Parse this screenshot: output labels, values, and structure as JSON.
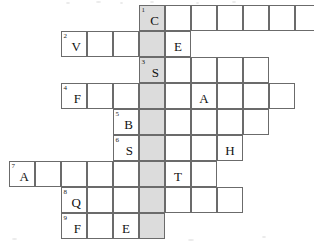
{
  "puzzle": {
    "type": "crossword",
    "title": "",
    "cell_size": 26,
    "grid_origin": {
      "x": 9,
      "y": 5
    },
    "shaded_column_index": 5,
    "shaded_color": "#dcdcdc",
    "cell_border_color": "#6b6b6b",
    "background_color": "#ffffff",
    "columns": 12,
    "rows": 9,
    "entries": [
      {
        "number": "1",
        "row": 0,
        "start_col": 5,
        "length": 7,
        "letters": [
          "C",
          "",
          "",
          "",
          "",
          "",
          ""
        ],
        "shaded_cols": [
          5
        ]
      },
      {
        "number": "2",
        "row": 1,
        "start_col": 2,
        "length": 5,
        "letters": [
          "V",
          "",
          "",
          "",
          "E"
        ],
        "shaded_cols": [
          5
        ]
      },
      {
        "number": "3",
        "row": 2,
        "start_col": 5,
        "length": 5,
        "letters": [
          "S",
          "",
          "",
          "",
          ""
        ],
        "shaded_cols": [
          5
        ]
      },
      {
        "number": "4",
        "row": 3,
        "start_col": 2,
        "length": 9,
        "letters": [
          "F",
          "",
          "",
          "",
          "",
          "A",
          "",
          "",
          ""
        ],
        "shaded_cols": [
          5
        ]
      },
      {
        "number": "5",
        "row": 4,
        "start_col": 4,
        "length": 6,
        "letters": [
          "B",
          "",
          "",
          "",
          "",
          ""
        ],
        "shaded_cols": [
          5
        ]
      },
      {
        "number": "6",
        "row": 5,
        "start_col": 4,
        "length": 5,
        "letters": [
          "S",
          "",
          "",
          "",
          "H"
        ],
        "shaded_cols": [
          5
        ]
      },
      {
        "number": "7",
        "row": 6,
        "start_col": 0,
        "length": 8,
        "letters": [
          "A",
          "",
          "",
          "",
          "",
          "",
          "T",
          ""
        ],
        "shaded_cols": [
          5
        ]
      },
      {
        "number": "8",
        "row": 7,
        "start_col": 2,
        "length": 7,
        "letters": [
          "Q",
          "",
          "",
          "",
          "",
          "",
          ""
        ],
        "shaded_cols": [
          5
        ]
      },
      {
        "number": "9",
        "row": 8,
        "start_col": 2,
        "length": 4,
        "letters": [
          "F",
          "",
          "E",
          ""
        ],
        "shaded_cols": [
          5
        ]
      }
    ]
  }
}
